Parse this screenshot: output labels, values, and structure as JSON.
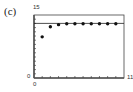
{
  "panel_label": "(c)",
  "chart_data": {
    "type": "scatter",
    "title": "",
    "xlabel": "",
    "ylabel": "",
    "xlim": [
      0,
      11
    ],
    "ylim": [
      0,
      15
    ],
    "x_tick_labels": [
      "0",
      "11"
    ],
    "y_tick_labels": [
      "0",
      "15"
    ],
    "x_ticks_every": 1,
    "y_ticks_every": 1,
    "grid": false,
    "series": [
      {
        "name": "sequence",
        "x": [
          1,
          2,
          3,
          4,
          5,
          6,
          7,
          8,
          9,
          10
        ],
        "values": [
          9.8,
          12.2,
          12.7,
          12.9,
          12.9,
          12.9,
          12.9,
          12.9,
          12.9,
          12.9
        ]
      }
    ],
    "annotations": [
      {
        "type": "horizontal_line",
        "y": 13,
        "label": "asymptote"
      }
    ]
  },
  "labels": {
    "y_max": "15",
    "y_min": "0",
    "x_min": "0",
    "x_max": "11"
  }
}
